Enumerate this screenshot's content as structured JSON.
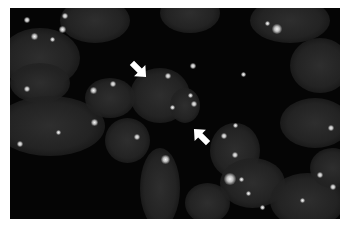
{
  "image": {
    "type": "fluorescence micrograph",
    "description": "Grayscale fluorescence microscopy image of cell nuclei on dark background with bright punctate foci",
    "colors": {
      "background": "#050505",
      "nuclei": "#2a2a2a",
      "foci": "#f4f4f4",
      "arrows": "#ffffff",
      "border": "#ffffff"
    },
    "arrows": [
      {
        "id": "arrow-1",
        "direction": "down-right",
        "x": 135,
        "y": 60
      },
      {
        "id": "arrow-2",
        "direction": "up-left",
        "x": 196,
        "y": 133
      }
    ]
  }
}
